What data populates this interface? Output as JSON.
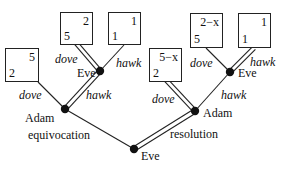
{
  "diagram": {
    "type": "game-tree",
    "root": {
      "player": "Eve",
      "moves": [
        "equivocation",
        "resolution"
      ]
    },
    "left_subtree": {
      "move_label": "equivocation",
      "player": "Adam",
      "dove_label": "dove",
      "hawk_label": "hawk",
      "dove_payoff": {
        "top_right": "5",
        "bottom_left": "2"
      },
      "eve_node": {
        "player": "Eve",
        "dove_label": "dove",
        "hawk_label": "hawk",
        "dove_payoff": {
          "top_right": "2",
          "bottom_left": "5"
        },
        "hawk_payoff": {
          "top_right": "1",
          "bottom_left": "1"
        }
      }
    },
    "right_subtree": {
      "move_label": "resolution",
      "player": "Adam",
      "dove_label": "dove",
      "hawk_label": "hawk",
      "dove_payoff": {
        "top_right": "5−x",
        "bottom_left": "2"
      },
      "eve_node": {
        "player": "Eve",
        "dove_label": "dove",
        "hawk_label": "hawk",
        "dove_payoff": {
          "top_right": "2−x",
          "bottom_left": "5"
        },
        "hawk_payoff": {
          "top_right": "1",
          "bottom_left": "1"
        }
      }
    }
  }
}
